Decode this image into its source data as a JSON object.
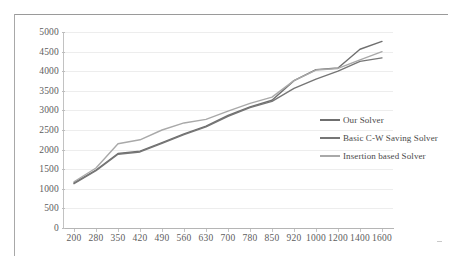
{
  "chart_data": {
    "type": "line",
    "title": "",
    "xlabel": "",
    "ylabel": "",
    "categories": [
      "200",
      "280",
      "350",
      "420",
      "490",
      "560",
      "630",
      "700",
      "780",
      "850",
      "920",
      "1000",
      "1200",
      "1400",
      "1600"
    ],
    "yticks": [
      "0",
      "500",
      "1000",
      "1500",
      "2000",
      "2500",
      "3000",
      "3500",
      "4000",
      "4500",
      "5000"
    ],
    "ylim": [
      0,
      5000
    ],
    "grid": true,
    "legend_position": "right-inside",
    "series": [
      {
        "name": "Our Solver",
        "color": "#6f6f6f",
        "values": [
          1150,
          1480,
          1900,
          1960,
          2180,
          2400,
          2600,
          2870,
          3090,
          3260,
          3760,
          4040,
          4080,
          4560,
          4760
        ]
      },
      {
        "name": "Basic C-W Saving Solver",
        "color": "#767676",
        "values": [
          1130,
          1460,
          1880,
          1940,
          2160,
          2380,
          2580,
          2850,
          3070,
          3230,
          3560,
          3800,
          4000,
          4250,
          4340
        ]
      },
      {
        "name": "Insertion based Solver",
        "color": "#a9a9a9",
        "values": [
          1180,
          1530,
          2150,
          2250,
          2500,
          2680,
          2770,
          2980,
          3180,
          3340,
          3760,
          4030,
          4070,
          4290,
          4500
        ]
      }
    ]
  },
  "legend": {
    "items": [
      {
        "label": "Our Solver",
        "color": "#6f6f6f"
      },
      {
        "label": "Basic C-W Saving Solver",
        "color": "#767676"
      },
      {
        "label": "Insertion based Solver",
        "color": "#a9a9a9"
      }
    ]
  }
}
